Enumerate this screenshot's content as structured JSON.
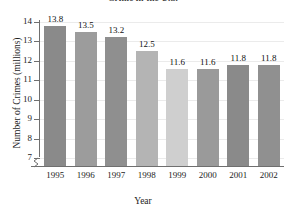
{
  "chart_data": {
    "type": "bar",
    "title": "Crime in the U.S.",
    "xlabel": "Year",
    "ylabel": "Number of Crimes (millions)",
    "categories": [
      "1995",
      "1996",
      "1997",
      "1998",
      "1999",
      "2000",
      "2001",
      "2002"
    ],
    "values": [
      13.8,
      13.5,
      13.2,
      12.5,
      11.6,
      11.6,
      11.8,
      11.8
    ],
    "value_labels": [
      "13.8",
      "13.5",
      "13.2",
      "12.5",
      "11.6",
      "11.6",
      "11.8",
      "11.8"
    ],
    "bar_colors": [
      "#8a8a8a",
      "#9c9c9c",
      "#8f8f8f",
      "#b4b4b4",
      "#cfcfcf",
      "#9a9a9a",
      "#8a8a8a",
      "#909090"
    ],
    "ylim": [
      6.6,
      14.4
    ],
    "yticks": [
      7,
      8,
      9,
      10,
      11,
      12,
      13,
      14
    ],
    "ytick_labels": [
      "7",
      "8",
      "9",
      "10",
      "11",
      "12",
      "13",
      "14"
    ],
    "grid": true,
    "grid_color": "#ebebeb",
    "axis_color": "#6f6f6f",
    "axis_break": true,
    "legend": false
  }
}
